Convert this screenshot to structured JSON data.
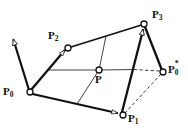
{
  "figure": {
    "background_color": "#ffffff",
    "stroke_color": "#111111",
    "marker_fill": "#ffffff",
    "dashed_color": "#333333"
  },
  "labels": {
    "p0": {
      "base": "P",
      "sub": "0",
      "sup": ""
    },
    "p1": {
      "base": "P",
      "sub": "1",
      "sup": ""
    },
    "p2": {
      "base": "P",
      "sub": "2",
      "sup": ""
    },
    "p3": {
      "base": "P",
      "sub": "3",
      "sup": ""
    },
    "p": {
      "base": "P",
      "sub": "",
      "sup": ""
    },
    "p0star": {
      "base": "P",
      "sub": "0",
      "sup": "*"
    }
  },
  "points": {
    "p0": {
      "x": 30,
      "y": 92,
      "label": "P0"
    },
    "p1": {
      "x": 123,
      "y": 115,
      "label": "P1"
    },
    "p2": {
      "x": 68,
      "y": 48,
      "label": "P2"
    },
    "p3": {
      "x": 144,
      "y": 24,
      "label": "P3"
    },
    "p": {
      "x": 99,
      "y": 70,
      "label": "P"
    },
    "p0star": {
      "x": 163,
      "y": 72,
      "label": "P0*"
    }
  },
  "label_positions": {
    "p0": {
      "x": 3,
      "y": 93
    },
    "p1": {
      "x": 128,
      "y": 115
    },
    "p2": {
      "x": 49,
      "y": 35
    },
    "p3": {
      "x": 151,
      "y": 14
    },
    "p": {
      "x": 96,
      "y": 76
    },
    "p0star": {
      "x": 167,
      "y": 67
    }
  },
  "edges": {
    "thick": [
      {
        "name": "p0-to-p2",
        "from": "p0",
        "to": "p2",
        "arrow": true
      },
      {
        "name": "p2-to-p3",
        "from": "p2",
        "to": "p3",
        "arrow": false
      },
      {
        "name": "p0-to-p1",
        "from": "p0",
        "to": "p1",
        "arrow": true
      },
      {
        "name": "p1-to-p3",
        "from": "p1",
        "to": "p3",
        "arrow": true
      },
      {
        "name": "p3-to-p0star",
        "from": "p3",
        "to": "p0star",
        "arrow": false
      }
    ],
    "thin": [
      {
        "name": "mid-horizontal",
        "from": "p0p2-mid",
        "to": "p1p3-mid"
      },
      {
        "name": "mid-vertical",
        "from": "p0p1-mid",
        "to": "p2p3-mid"
      }
    ],
    "dashed": [
      {
        "name": "p0star-to-p1",
        "from": "p0star",
        "to": "p1"
      },
      {
        "name": "p0star-to-interior",
        "from": "p0star",
        "to": "p1p3-mid"
      }
    ],
    "tangent": {
      "name": "tangent-at-p0",
      "from": "p0",
      "to": {
        "x": 10,
        "y": 35
      },
      "arrow": true
    }
  },
  "markers": {
    "radius": 3.0,
    "names": [
      "p0",
      "p1",
      "p2",
      "p3",
      "p",
      "p0star"
    ]
  }
}
